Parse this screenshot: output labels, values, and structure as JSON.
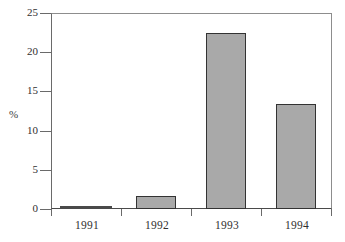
{
  "chart_data": {
    "type": "bar",
    "title": "",
    "xlabel": "",
    "ylabel": "%",
    "categories": [
      "1991",
      "1992",
      "1993",
      "1994"
    ],
    "values": [
      0.1,
      1.7,
      22.4,
      13.4
    ],
    "ylim": [
      0,
      25
    ],
    "yticks": [
      0,
      5,
      10,
      15,
      20,
      25
    ],
    "ytick_labels": [
      "0",
      "5",
      "10",
      "15",
      "20",
      "25"
    ],
    "grid": false,
    "legend": null,
    "bar_fill_color": "#a9a9a9",
    "bar_border_color": "#333333",
    "axis_color": "#6a6a6a",
    "plot_background": "#ffffff"
  },
  "axis": {
    "y_label": "%",
    "y_ticks": [
      {
        "label": "25",
        "value": 25
      },
      {
        "label": "20",
        "value": 20
      },
      {
        "label": "15",
        "value": 15
      },
      {
        "label": "10",
        "value": 10
      },
      {
        "label": "5",
        "value": 5
      },
      {
        "label": "0",
        "value": 0
      }
    ],
    "x_ticks": [
      {
        "label": "1991"
      },
      {
        "label": "1992"
      },
      {
        "label": "1993"
      },
      {
        "label": "1994"
      }
    ]
  }
}
